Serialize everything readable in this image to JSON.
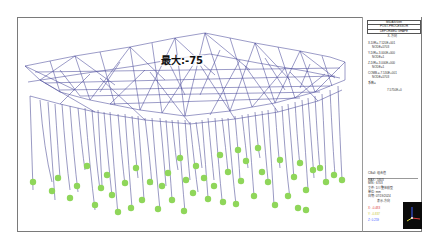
{
  "viewport": {
    "max_label": "最大:-75",
    "member_color": "#4a4a9a",
    "support_color": "#8fd65a",
    "background": "#ffffff"
  },
  "legend": {
    "header": [
      "MIDAS/Gen",
      "POST-PROCESSOR",
      "DEFORMED SHAPE"
    ],
    "direction_label": "X-方向",
    "lines": [
      "X-DIR=-7.520E+001",
      "NODE=5703",
      "Y-DIR=-3.000E+000",
      "NODE=1",
      "Z-DIR=-3.000E+000",
      "NODE=1",
      "COMB.=-7.530E+001",
      "NODE=5703",
      "系数="
    ],
    "scale_value": "7.5750E+0",
    "footer": {
      "case": "CBall: 组合值",
      "max_row": "MAX : 5803",
      "min_row": "MIN : 6703",
      "file_row": "文件: 1##整体模型",
      "unit_row": "单位: mm",
      "date_row": "日期: 07/19/2024",
      "view_row": "表示-方向",
      "axis_x": "X: -0.483",
      "axis_y": "Y: -0.837",
      "axis_z": "Z: 0.259"
    },
    "axis_colors": {
      "x": "#e04040",
      "y": "#d8d840",
      "z": "#4060ff"
    }
  }
}
